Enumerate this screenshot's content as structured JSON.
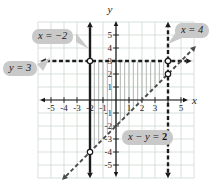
{
  "figure": {
    "callouts": [
      {
        "id": "x-eq-neg2",
        "text": "x = −2"
      },
      {
        "id": "y-eq-3",
        "text": "y = 3"
      },
      {
        "id": "x-eq-4",
        "text": "x = 4"
      },
      {
        "id": "x-minus-y-eq-2",
        "text": "x − y = ",
        "bold_value": "2"
      }
    ]
  },
  "chart_data": {
    "type": "line",
    "title": "",
    "axis_labels": {
      "x": "x",
      "y": "y"
    },
    "x_range": [
      -6,
      6
    ],
    "y_range": [
      -6,
      6
    ],
    "grid": true,
    "grid_color": "#cfd9d0",
    "background": "#ffffff",
    "x_tick_labels": [
      "-5",
      "-4",
      "-3",
      "-2",
      "-1",
      "1",
      "2",
      "3",
      "5"
    ],
    "y_tick_labels": [
      "5",
      "4",
      "3",
      "2",
      "1",
      "-1",
      "-2",
      "-3",
      "-4",
      "-5"
    ],
    "series": [
      {
        "name": "x = -2",
        "equation": "x = -2",
        "style": "solid",
        "color": "#1c1c1c",
        "width": 2.4,
        "points": [
          [
            -2,
            -5.6
          ],
          [
            -2,
            5.6
          ]
        ]
      },
      {
        "name": "y = 3",
        "equation": "y = 3",
        "style": "dashed",
        "color": "#1c1c1c",
        "width": 2.4,
        "points": [
          [
            -5.4,
            3
          ],
          [
            5.4,
            3
          ]
        ]
      },
      {
        "name": "x = 4",
        "equation": "x = 4",
        "style": "dashed",
        "color": "#1c1c1c",
        "width": 2.4,
        "points": [
          [
            4,
            -5.6
          ],
          [
            4,
            5.6
          ]
        ]
      },
      {
        "name": "x - y = 2",
        "equation": "x - y = 2",
        "style": "dashed",
        "color": "#4a4a4a",
        "width": 1.9,
        "points": [
          [
            -3.85,
            -5.85
          ],
          [
            5.85,
            3.85
          ]
        ]
      }
    ],
    "open_points": [
      [
        -2,
        3
      ],
      [
        4,
        3
      ],
      [
        4,
        2
      ],
      [
        -2,
        -4
      ]
    ],
    "shaded_region": {
      "hatch": "vertical",
      "hatch_color": "#a9afa9",
      "x_min": -2,
      "x_max": 4,
      "y_top": 3,
      "bottom_slope": 1,
      "bottom_intercept": -2,
      "step": 0.3333
    }
  }
}
